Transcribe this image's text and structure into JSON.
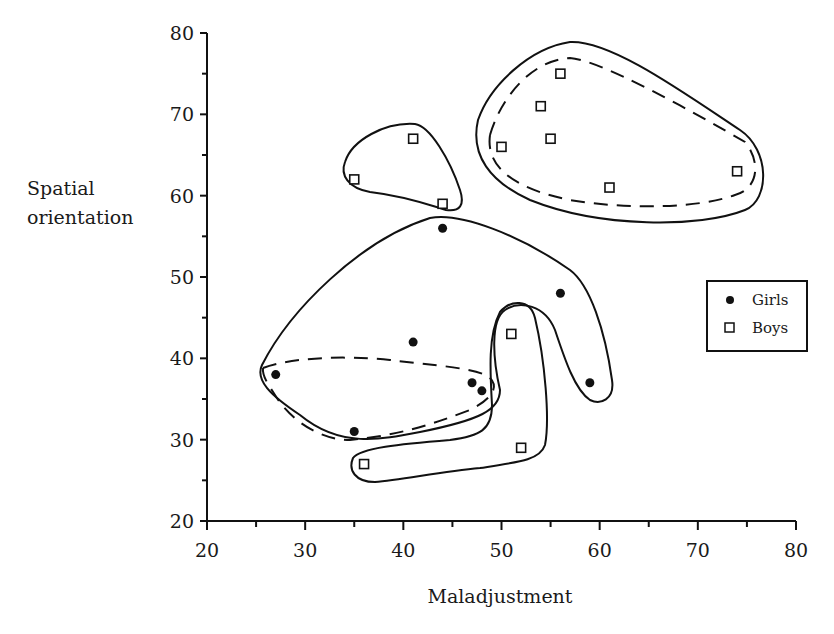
{
  "chart_data": {
    "type": "scatter",
    "title": "",
    "xlabel": "Maladjustment",
    "ylabel": "Spatial orientation",
    "xlim": [
      20,
      80
    ],
    "ylim": [
      20,
      80
    ],
    "xticks": [
      20,
      30,
      40,
      50,
      60,
      70,
      80
    ],
    "yticks": [
      20,
      30,
      40,
      50,
      60,
      70,
      80
    ],
    "grid": false,
    "legend_position": "right, inside plot",
    "series": [
      {
        "name": "Girls",
        "marker": "filled-circle",
        "points": [
          {
            "x": 44,
            "y": 56
          },
          {
            "x": 56,
            "y": 48
          },
          {
            "x": 41,
            "y": 42
          },
          {
            "x": 27,
            "y": 38
          },
          {
            "x": 47,
            "y": 37
          },
          {
            "x": 48,
            "y": 36
          },
          {
            "x": 59,
            "y": 37
          },
          {
            "x": 35,
            "y": 31
          }
        ]
      },
      {
        "name": "Boys",
        "marker": "open-square",
        "points": [
          {
            "x": 56,
            "y": 75
          },
          {
            "x": 54,
            "y": 71
          },
          {
            "x": 55,
            "y": 67
          },
          {
            "x": 50,
            "y": 66
          },
          {
            "x": 61,
            "y": 61
          },
          {
            "x": 74,
            "y": 63
          },
          {
            "x": 41,
            "y": 67
          },
          {
            "x": 35,
            "y": 62
          },
          {
            "x": 44,
            "y": 59
          },
          {
            "x": 51,
            "y": 43
          },
          {
            "x": 52,
            "y": 29
          },
          {
            "x": 36,
            "y": 27
          }
        ]
      }
    ],
    "annotations": [
      "Solid contours enclose clusters: boys upper-right (7 pts), boys upper-left (3 pts), girls large region (8 pts), boys lower hook (3 pts)",
      "Dashed contours enclose tighter sub-clusters: boys upper-right (6 pts) and girls lower-left (5 pts)"
    ]
  },
  "axes": {
    "x_label": "Maladjustment",
    "y_label_line1": "Spatial",
    "y_label_line2": "orientation",
    "x_ticks": [
      "20",
      "30",
      "40",
      "50",
      "60",
      "70",
      "80"
    ],
    "y_ticks": [
      "20",
      "30",
      "40",
      "50",
      "60",
      "70",
      "80"
    ]
  },
  "legend": {
    "items": [
      {
        "label": "Girls",
        "marker": "filled-circle"
      },
      {
        "label": "Boys",
        "marker": "open-square"
      }
    ]
  },
  "colors": {
    "ink": "#111111",
    "background": "#ffffff"
  }
}
